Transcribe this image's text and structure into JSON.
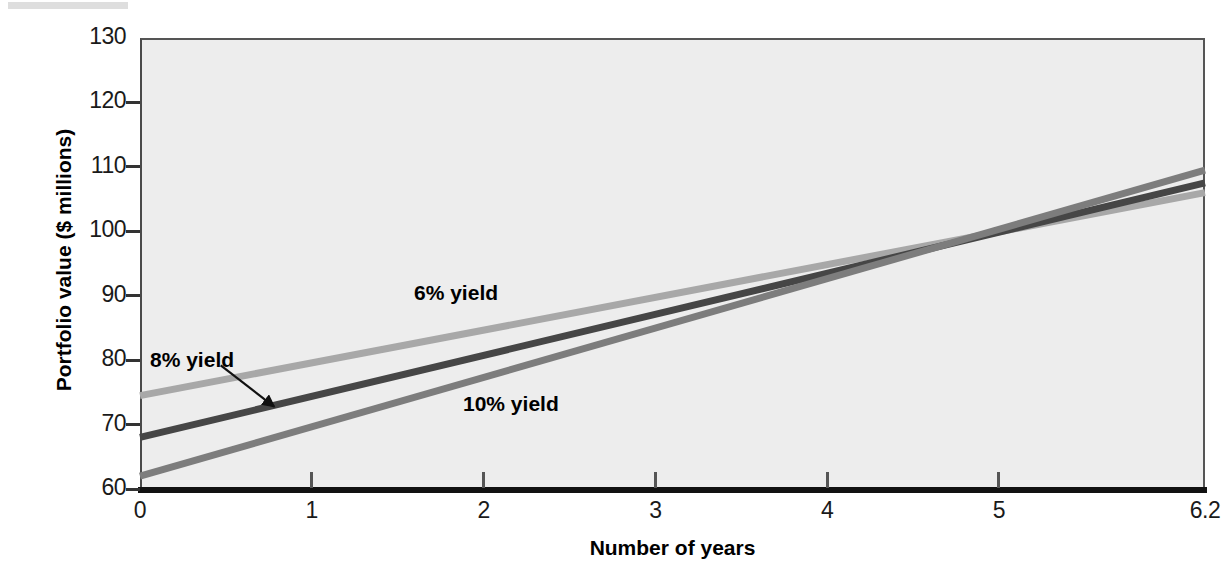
{
  "chart_data": {
    "type": "line",
    "title": "",
    "xlabel": "Number of years",
    "ylabel": "Portfolio value ($ millions)",
    "xlim": [
      0,
      6.2
    ],
    "ylim": [
      60,
      130
    ],
    "xticks": [
      "0",
      "1",
      "2",
      "3",
      "4",
      "5",
      "6.2"
    ],
    "xtick_values": [
      0,
      1,
      2,
      3,
      4,
      5,
      6.2
    ],
    "yticks": [
      "60",
      "70",
      "80",
      "90",
      "100",
      "110",
      "120",
      "130"
    ],
    "ytick_values": [
      60,
      70,
      80,
      90,
      100,
      110,
      120,
      130
    ],
    "grid": false,
    "legend": "inline annotations",
    "x": [
      0,
      6.2
    ],
    "series": [
      {
        "name": "6% yield",
        "label": "6% yield",
        "color": "#a8a8a8",
        "values": [
          74.5,
          106.0
        ]
      },
      {
        "name": "8% yield",
        "label": "8% yield",
        "color": "#464646",
        "values": [
          68.0,
          107.5
        ]
      },
      {
        "name": "10% yield",
        "label": "10% yield",
        "color": "#7d7d7d",
        "values": [
          62.0,
          109.5
        ]
      }
    ],
    "annotations": [
      {
        "text": "6% yield",
        "x": 1.85,
        "y": 91.5
      },
      {
        "text": "8% yield",
        "x": 0.12,
        "y": 81.0,
        "arrow_to": {
          "x": 0.78,
          "y": 72.8
        }
      },
      {
        "text": "10% yield",
        "x": 2.18,
        "y": 74.5
      }
    ],
    "plot_background": "#ededed",
    "axis_color": "#333333"
  },
  "axes": {
    "y_title": "Portfolio value ($ millions)",
    "x_title": "Number of years",
    "y_tick_labels": [
      "130",
      "120",
      "110",
      "100",
      "90",
      "80",
      "70",
      "60"
    ],
    "x_tick_labels": [
      "0",
      "1",
      "2",
      "3",
      "4",
      "5",
      "6.2"
    ]
  },
  "series_labels": {
    "six": "6% yield",
    "eight": "8% yield",
    "ten": "10% yield"
  }
}
